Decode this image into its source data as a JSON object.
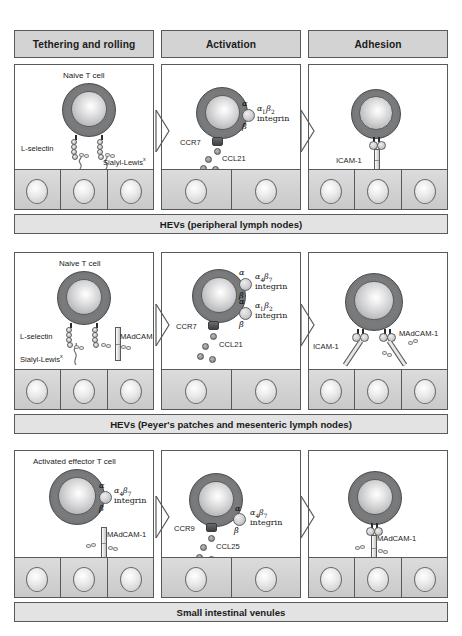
{
  "figure": {
    "columns": [
      {
        "label": "Tethering and rolling"
      },
      {
        "label": "Activation"
      },
      {
        "label": "Adhesion"
      }
    ]
  },
  "colors": {
    "header_fill": "#d3d3d3",
    "caption_fill": "#e3e3e3",
    "outline": "#58595b",
    "tcell_membrane": "#76777a",
    "endothelium": "#cfcfcf",
    "chemokine": "#8a8b8d"
  },
  "rows": [
    {
      "id": "hev-peripheral",
      "caption": "HEVs (peripheral lymph nodes)",
      "panels": [
        {
          "stage": "Tethering and rolling",
          "cell_label": "Naive T cell",
          "labels": [
            "L-selectin",
            "Sialyl-Lewis"
          ],
          "superscripts": [
            "x"
          ],
          "molecules": [
            "L-selectin",
            "Sialyl-Lewis x"
          ]
        },
        {
          "stage": "Activation",
          "cell_label": "",
          "receptor_label": "CCR7",
          "chemokine_label": "CCL21",
          "integrin": {
            "alpha": "α",
            "beta": "β",
            "name_sym": "α",
            "name_sub": "L",
            "name_sym2": "β",
            "name_sub2": "2",
            "word": "integrin"
          }
        },
        {
          "stage": "Adhesion",
          "cell_label": "",
          "labels": [
            "ICAM-1"
          ]
        }
      ]
    },
    {
      "id": "hev-peyers",
      "caption": "HEVs (Peyer's patches and mesenteric lymph nodes)",
      "panels": [
        {
          "stage": "Tethering and rolling",
          "cell_label": "Naive T cell",
          "labels": [
            "L-selectin",
            "Sialyl-Lewis",
            "MAdCAM-1"
          ],
          "superscripts": [
            "x"
          ]
        },
        {
          "stage": "Activation",
          "cell_label": "",
          "receptor_label": "CCR7",
          "chemokine_label": "CCL21",
          "integrins": [
            {
              "alpha": "α",
              "beta": "β",
              "name_sym": "α",
              "name_sub": "4",
              "name_sym2": "β",
              "name_sub2": "7",
              "word": "integrin"
            },
            {
              "alpha": "α",
              "beta": "β",
              "name_sym": "α",
              "name_sub": "L",
              "name_sym2": "β",
              "name_sub2": "2",
              "word": "integrin"
            }
          ]
        },
        {
          "stage": "Adhesion",
          "cell_label": "",
          "labels": [
            "ICAM-1",
            "MAdCAM-1"
          ]
        }
      ]
    },
    {
      "id": "small-intestinal-venules",
      "caption": "Small intestinal venules",
      "panels": [
        {
          "stage": "Tethering and rolling",
          "cell_label": "Activated effector T cell",
          "labels": [
            "MAdCAM-1"
          ],
          "integrin": {
            "alpha": "α",
            "beta": "β",
            "name_sym": "α",
            "name_sub": "4",
            "name_sym2": "β",
            "name_sub2": "7",
            "word": "integrin"
          }
        },
        {
          "stage": "Activation",
          "cell_label": "",
          "receptor_label": "CCR9",
          "chemokine_label": "CCL25",
          "integrin": {
            "alpha": "α",
            "beta": "β",
            "name_sym": "α",
            "name_sub": "4",
            "name_sym2": "β",
            "name_sub2": "7",
            "word": "integrin"
          }
        },
        {
          "stage": "Adhesion",
          "cell_label": "",
          "labels": [
            "MAdCAM-1"
          ]
        }
      ]
    }
  ],
  "glyphs": {
    "alpha": "α",
    "beta": "β",
    "sialyl_superscript": "x"
  }
}
